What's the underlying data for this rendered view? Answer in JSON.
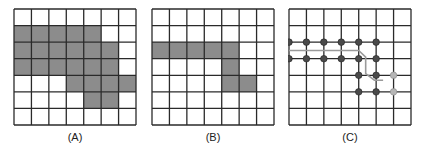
{
  "figure": {
    "grid_size": {
      "rows": 7,
      "cols": 7
    },
    "colors": {
      "line": "#2a2a2a",
      "fill": "#8c8c8c",
      "dot_dark": "#4a4a4a",
      "dot_light": "#b5b5b5",
      "path": "#9a9a9a"
    },
    "panels": [
      {
        "label": "(A)",
        "shaded_cells": [
          [
            1,
            0
          ],
          [
            1,
            1
          ],
          [
            1,
            2
          ],
          [
            1,
            3
          ],
          [
            1,
            4
          ],
          [
            2,
            0
          ],
          [
            2,
            1
          ],
          [
            2,
            2
          ],
          [
            2,
            3
          ],
          [
            2,
            4
          ],
          [
            2,
            5
          ],
          [
            3,
            0
          ],
          [
            3,
            1
          ],
          [
            3,
            2
          ],
          [
            3,
            3
          ],
          [
            3,
            4
          ],
          [
            3,
            5
          ],
          [
            4,
            3
          ],
          [
            4,
            4
          ],
          [
            4,
            5
          ],
          [
            4,
            6
          ],
          [
            5,
            4
          ],
          [
            5,
            5
          ]
        ]
      },
      {
        "label": "(B)",
        "shaded_cells": [
          [
            2,
            0
          ],
          [
            2,
            1
          ],
          [
            2,
            2
          ],
          [
            2,
            3
          ],
          [
            2,
            4
          ],
          [
            3,
            4
          ],
          [
            4,
            4
          ],
          [
            4,
            5
          ]
        ]
      },
      {
        "label": "(C)",
        "dots_dark": [
          [
            2,
            0
          ],
          [
            2,
            1
          ],
          [
            2,
            2
          ],
          [
            2,
            3
          ],
          [
            2,
            4
          ],
          [
            2,
            5
          ],
          [
            3,
            0
          ],
          [
            3,
            1
          ],
          [
            3,
            2
          ],
          [
            3,
            3
          ],
          [
            3,
            4
          ],
          [
            3,
            5
          ],
          [
            4,
            4
          ],
          [
            4,
            5
          ],
          [
            5,
            4
          ],
          [
            5,
            5
          ]
        ],
        "dots_light": [
          [
            4,
            6
          ],
          [
            5,
            6
          ]
        ],
        "path_points": [
          [
            0,
            2.5
          ],
          [
            4,
            2.5
          ],
          [
            4.4,
            2.9
          ],
          [
            4.4,
            3.9
          ],
          [
            4.9,
            4.3
          ],
          [
            5.4,
            4.3
          ]
        ]
      }
    ]
  }
}
